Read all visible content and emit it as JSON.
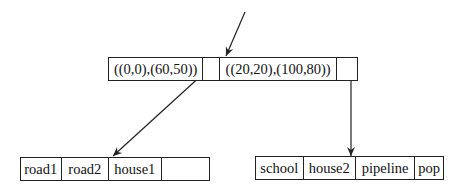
{
  "diagram": {
    "type": "r-tree",
    "root_node": {
      "entries": [
        {
          "label": "((0,0),(60,50))",
          "pointer": "leaf-left"
        },
        {
          "label": "((20,20),(100,80))",
          "pointer": "leaf-right"
        }
      ]
    },
    "leaf_left": {
      "entries": [
        "road1",
        "road2",
        "house1",
        ""
      ]
    },
    "leaf_right": {
      "entries": [
        "school",
        "house2",
        "pipeline",
        "pop"
      ]
    },
    "colors": {
      "line": "#222222",
      "background": "#ffffff"
    }
  }
}
